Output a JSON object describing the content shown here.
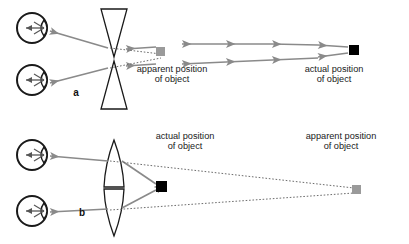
{
  "figure": {
    "background_color": "#ffffff",
    "width": 409,
    "height": 244,
    "colors": {
      "ray_gray": "#8a8a8a",
      "outline_black": "#1a1a1a",
      "actual_object_fill": "#000000",
      "apparent_object_fill": "#9a9a9a",
      "dashed_line": "#6d6d6d",
      "text": "#1a1a1a"
    }
  },
  "panels": [
    {
      "id": "a",
      "letter": "a",
      "letter_pos": {
        "x": 76,
        "y": 93
      },
      "lens_type": "diverging",
      "lens_type_label": "concave (diverging) lens",
      "eyes": [
        {
          "cx": 32,
          "cy": 28,
          "r": 15
        },
        {
          "cx": 32,
          "cy": 80,
          "r": 15
        }
      ],
      "lenses": [
        {
          "shape": "triangle-down",
          "cx": 114,
          "top": 9,
          "bottom": 57,
          "half_width": 13
        },
        {
          "shape": "triangle-up",
          "cx": 114,
          "top": 61,
          "bottom": 109,
          "half_width": 13
        }
      ],
      "objects": [
        {
          "kind": "apparent",
          "label": "apparent position\nof object",
          "label_lines": [
            "apparent position",
            "of object"
          ],
          "label_pos": {
            "x": 172,
            "y": 73
          },
          "marker": {
            "x": 160,
            "y": 52,
            "size": 9,
            "fill": "#9a9a9a"
          }
        },
        {
          "kind": "actual",
          "label": "actual position\nof object",
          "label_lines": [
            "actual position",
            "of object"
          ],
          "label_pos": {
            "x": 334,
            "y": 73
          },
          "marker": {
            "x": 353,
            "y": 50,
            "size": 9,
            "fill": "#000000"
          }
        }
      ],
      "ray_direction": "right-to-left",
      "ray_rows": [
        {
          "y": 46,
          "from_x": 350,
          "to_x": 128,
          "arrow_count": 4
        },
        {
          "y": 62,
          "from_x": 350,
          "to_x": 128,
          "arrow_count": 4
        }
      ],
      "exit_rays": [
        {
          "from": {
            "x": 103,
            "y": 48
          },
          "to": {
            "x": 52,
            "y": 31
          }
        },
        {
          "from": {
            "x": 103,
            "y": 69
          },
          "to": {
            "x": 52,
            "y": 83
          }
        }
      ],
      "dashed_construction_lines": [
        {
          "from": {
            "x": 112,
            "y": 48
          },
          "to": {
            "x": 161,
            "y": 55
          }
        },
        {
          "from": {
            "x": 112,
            "y": 68
          },
          "to": {
            "x": 161,
            "y": 57
          }
        }
      ]
    },
    {
      "id": "b",
      "letter": "b",
      "letter_pos": {
        "x": 82,
        "y": 213
      },
      "lens_type": "converging",
      "lens_type_label": "convex (converging) lens",
      "eyes": [
        {
          "cx": 32,
          "cy": 155,
          "r": 15
        },
        {
          "cx": 32,
          "cy": 211,
          "r": 15
        }
      ],
      "lenses": [
        {
          "shape": "lens-convex",
          "cx": 114,
          "top": 140,
          "bottom": 187,
          "half_width": 9
        },
        {
          "shape": "lens-convex",
          "cx": 114,
          "top": 189,
          "bottom": 236,
          "half_width": 9
        }
      ],
      "objects": [
        {
          "kind": "actual",
          "label": "actual position\nof object",
          "label_lines": [
            "actual position",
            "of object"
          ],
          "label_pos": {
            "x": 185,
            "y": 140
          },
          "marker": {
            "x": 160,
            "y": 185,
            "size": 9,
            "fill": "#000000"
          }
        },
        {
          "kind": "apparent",
          "label": "apparent position\nof object",
          "label_lines": [
            "apparent position",
            "of object"
          ],
          "label_pos": {
            "x": 341,
            "y": 140
          },
          "marker": {
            "x": 356,
            "y": 189,
            "size": 9,
            "fill": "#9a9a9a"
          }
        }
      ],
      "ray_direction": "right-to-left",
      "incident_rays": [
        {
          "from": {
            "x": 154,
            "y": 183
          },
          "to": {
            "x": 122,
            "y": 162
          }
        },
        {
          "from": {
            "x": 154,
            "y": 189
          },
          "to": {
            "x": 122,
            "y": 207
          }
        }
      ],
      "exit_rays": [
        {
          "from": {
            "x": 106,
            "y": 161
          },
          "to": {
            "x": 52,
            "y": 156
          }
        },
        {
          "from": {
            "x": 106,
            "y": 208
          },
          "to": {
            "x": 52,
            "y": 212
          }
        }
      ],
      "dashed_construction_lines": [
        {
          "from": {
            "x": 110,
            "y": 161
          },
          "to": {
            "x": 353,
            "y": 188
          }
        },
        {
          "from": {
            "x": 110,
            "y": 209
          },
          "to": {
            "x": 353,
            "y": 192
          }
        }
      ]
    }
  ]
}
